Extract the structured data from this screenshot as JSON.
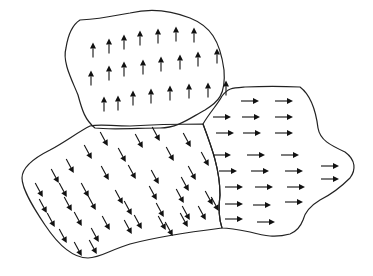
{
  "diagram": {
    "width": 373,
    "height": 276,
    "stroke_color": "#222222",
    "arrow_color": "#111111",
    "background": "#ffffff",
    "domains": [
      {
        "name": "domain-up",
        "direction": "up",
        "angle_deg": -90,
        "arrow_length": 15,
        "path": "M80,20 C110,18 115,15 130,13 C150,8 170,10 190,18 C210,26 220,40 224,70 C226,95 218,102 205,110 C190,118 178,128 160,128 C140,128 110,130 95,128 C85,120 82,110 78,95 C72,80 62,62 66,48 C68,35 72,25 80,20 Z",
        "arrows": [
          [
            93,
            50
          ],
          [
            109,
            46
          ],
          [
            124,
            42
          ],
          [
            140,
            38
          ],
          [
            158,
            36
          ],
          [
            176,
            34
          ],
          [
            194,
            35
          ],
          [
            91,
            78
          ],
          [
            109,
            73
          ],
          [
            124,
            69
          ],
          [
            143,
            67
          ],
          [
            161,
            64
          ],
          [
            180,
            62
          ],
          [
            198,
            59
          ],
          [
            217,
            56
          ],
          [
            104,
            104
          ],
          [
            118,
            103
          ],
          [
            133,
            98
          ],
          [
            151,
            96
          ],
          [
            170,
            93
          ],
          [
            189,
            91
          ],
          [
            208,
            90
          ],
          [
            226,
            88
          ]
        ]
      },
      {
        "name": "domain-diagonal",
        "direction": "down-right",
        "angle_deg": 62,
        "arrow_length": 16,
        "path": "M90,126 C100,124 110,126 130,126 C160,124 185,124 203,124 C212,148 220,170 220,195 C218,210 220,222 222,228 C190,232 160,236 130,244 C110,250 100,258 88,258 C70,258 55,240 45,225 C35,210 22,190 22,178 C22,168 34,158 50,150 C65,142 78,132 90,126 Z",
        "arrows": [
          [
            104,
            139
          ],
          [
            139,
            141
          ],
          [
            156,
            134
          ],
          [
            187,
            140
          ],
          [
            88,
            152
          ],
          [
            122,
            155
          ],
          [
            170,
            154
          ],
          [
            205,
            159
          ],
          [
            70,
            166
          ],
          [
            55,
            176
          ],
          [
            105,
            173
          ],
          [
            132,
            172
          ],
          [
            155,
            177
          ],
          [
            192,
            173
          ],
          [
            185,
            184
          ],
          [
            39,
            190
          ],
          [
            63,
            190
          ],
          [
            85,
            190
          ],
          [
            119,
            197
          ],
          [
            153,
            193
          ],
          [
            180,
            196
          ],
          [
            209,
            198
          ],
          [
            43,
            206
          ],
          [
            68,
            204
          ],
          [
            92,
            203
          ],
          [
            128,
            208
          ],
          [
            160,
            210
          ],
          [
            186,
            213
          ],
          [
            215,
            204
          ],
          [
            51,
            220
          ],
          [
            78,
            219
          ],
          [
            106,
            223
          ],
          [
            138,
            222
          ],
          [
            169,
            229
          ],
          [
            184,
            220
          ],
          [
            202,
            213
          ],
          [
            63,
            236
          ],
          [
            95,
            235
          ],
          [
            128,
            227
          ],
          [
            162,
            223
          ],
          [
            78,
            249
          ],
          [
            93,
            247
          ]
        ]
      },
      {
        "name": "domain-right",
        "direction": "right",
        "angle_deg": 0,
        "arrow_length": 18,
        "path": "M203,124 C210,112 218,104 222,96 C228,88 232,88 245,87 C265,86 280,86 300,87 C312,96 316,112 318,128 C320,140 330,145 345,152 C356,160 356,170 350,178 C342,186 330,195 320,200 C310,206 305,212 303,220 C300,228 295,232 290,234 C275,238 265,236 250,232 C240,230 230,228 222,228 C220,222 218,210 220,195 C220,170 212,148 203,124 Z",
        "arrows": [
          [
            250,
            101
          ],
          [
            284,
            101
          ],
          [
            222,
            117
          ],
          [
            251,
            117
          ],
          [
            284,
            117
          ],
          [
            225,
            133
          ],
          [
            252,
            133
          ],
          [
            284,
            133
          ],
          [
            222,
            155
          ],
          [
            256,
            155
          ],
          [
            290,
            155
          ],
          [
            228,
            171
          ],
          [
            260,
            171
          ],
          [
            294,
            171
          ],
          [
            330,
            166
          ],
          [
            234,
            187
          ],
          [
            264,
            187
          ],
          [
            296,
            187
          ],
          [
            330,
            179
          ],
          [
            234,
            204
          ],
          [
            262,
            205
          ],
          [
            294,
            202
          ],
          [
            234,
            219
          ],
          [
            266,
            222
          ]
        ]
      }
    ]
  }
}
